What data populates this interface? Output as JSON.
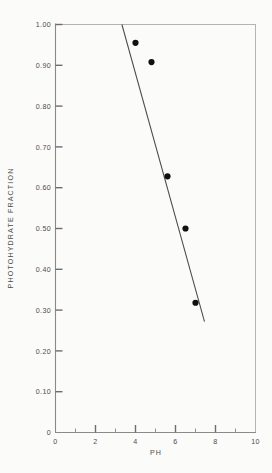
{
  "chart_data": {
    "type": "scatter",
    "title": "",
    "xlabel": "PH",
    "ylabel": "PHOTOHYDRATE FRACTION",
    "xlim": [
      0,
      10
    ],
    "ylim": [
      0,
      1.0
    ],
    "grid": false,
    "legend": null,
    "x_ticks_major": [
      0,
      2,
      4,
      6,
      8,
      10
    ],
    "x_tick_labels": [
      "0",
      "2",
      "4",
      "6",
      "8",
      "10"
    ],
    "x_ticks_minor": [
      1,
      3,
      5,
      7,
      9
    ],
    "y_ticks_major": [
      0,
      0.1,
      0.2,
      0.3,
      0.4,
      0.5,
      0.6,
      0.7,
      0.8,
      0.9,
      1.0
    ],
    "y_tick_labels": [
      "0",
      "0.10",
      "0.20",
      "0.30",
      "0.40",
      "0.50",
      "0.60",
      "0.70",
      "0.80",
      "0.90",
      "1.00"
    ],
    "series": [
      {
        "name": "photohydrate fraction vs pH",
        "marker": "filled-circle",
        "x": [
          4.0,
          4.8,
          5.6,
          6.5,
          7.0
        ],
        "y": [
          0.955,
          0.908,
          0.628,
          0.5,
          0.318
        ]
      }
    ],
    "fit_line": {
      "name": "linear trend",
      "x": [
        3.32,
        7.45
      ],
      "y": [
        1.0,
        0.272
      ]
    }
  },
  "style": {
    "paper_color": "#fbfbfa",
    "axis_color": "#8a8a8a",
    "frame_color": "#b4b4b4",
    "line_color": "#4a4a4a",
    "point_color": "#111111",
    "text_color": "#4c4c4c"
  }
}
